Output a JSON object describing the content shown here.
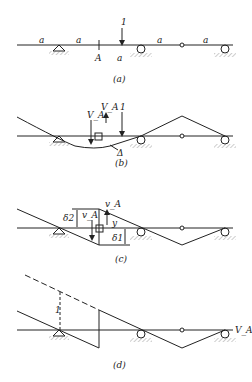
{
  "figure": {
    "panel_a": {
      "caption": "(a)",
      "span_labels": [
        "a",
        "a",
        "a",
        "a",
        "a"
      ],
      "section_label": "A",
      "load_label": "1"
    },
    "panel_b": {
      "caption": "(b)",
      "force_labels": [
        "V_A",
        "V_A"
      ],
      "load_label": "1",
      "displacement_label": "Δ"
    },
    "panel_c": {
      "caption": "(c)",
      "labels": {
        "delta2": "δ2",
        "vA_left": "v_A",
        "vA_right": "v_A",
        "y": "y",
        "delta1": "δ1"
      }
    },
    "panel_d": {
      "caption": "(d)",
      "unit_label": "1",
      "end_label": "V_A"
    }
  }
}
